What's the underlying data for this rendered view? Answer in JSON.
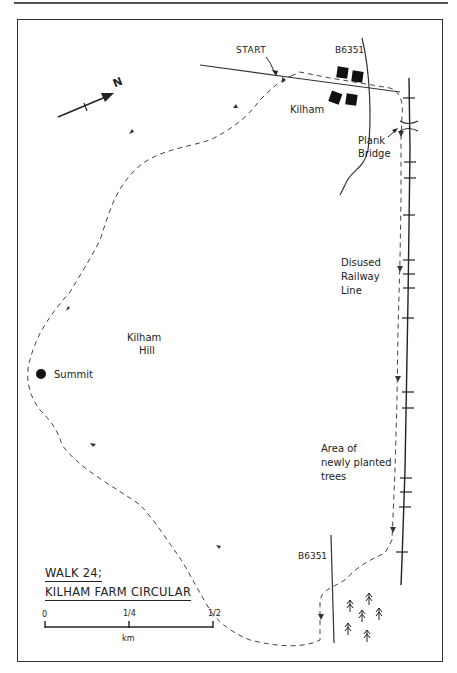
{
  "header": {
    "text": "ROUTE MAP"
  },
  "map": {
    "title_line1": "WALK 24;",
    "title_line2": "KILHAM FARM CIRCULAR",
    "north_label": "N",
    "labels": {
      "start": "START",
      "road_top": "B6351",
      "village": "Kilham",
      "plank_bridge_1": "Plank",
      "plank_bridge_2": "Bridge",
      "railway_1": "Disused",
      "railway_2": "Railway",
      "railway_3": "Line",
      "hill_1": "Kilham",
      "hill_2": "Hill",
      "summit": "Summit",
      "trees_1": "Area of",
      "trees_2": "newly planted",
      "trees_3": "trees",
      "road_bottom": "B6351"
    },
    "scale": {
      "ticks": [
        "0",
        "1/4",
        "1/2"
      ],
      "unit": "km"
    },
    "colors": {
      "ink": "#222222",
      "paper": "#ffffff",
      "route": "#444444"
    }
  }
}
